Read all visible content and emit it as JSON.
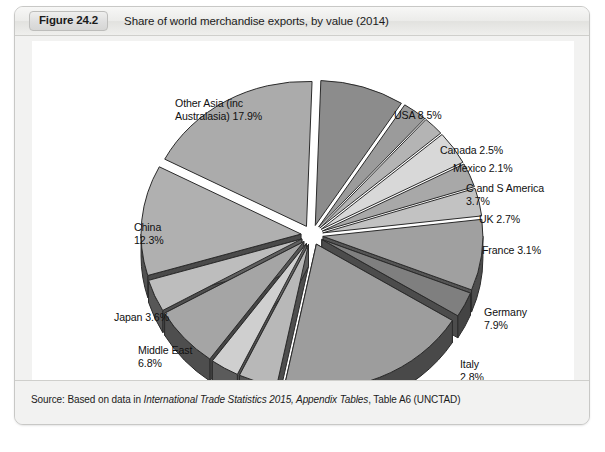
{
  "figure": {
    "badge": "Figure 24.2",
    "title": "Share of world merchandise exports, by value (2014)",
    "source_prefix": "Source: Based on data in ",
    "source_italic": "International Trade Statistics 2015, Appendix Tables",
    "source_suffix": ", Table A6 (UNCTAD)"
  },
  "chart_data": {
    "type": "pie",
    "title": "Share of world merchandise exports, by value (2014)",
    "unit": "%",
    "exploded": true,
    "three_d": true,
    "legend": "none",
    "labels_position": "outside",
    "total": 100.0,
    "categories": [
      "USA",
      "Canada",
      "Mexico",
      "C and S America",
      "UK",
      "France",
      "Germany",
      "Italy",
      "Other Europe",
      "CIS (former Soviet republics)",
      "Africa",
      "Middle East",
      "Japan",
      "China",
      "Other Asia (inc Australasia)"
    ],
    "values": [
      8.5,
      2.5,
      2.1,
      3.7,
      2.7,
      3.1,
      7.9,
      2.8,
      19.4,
      3.9,
      2.9,
      6.8,
      3.6,
      12.3,
      17.9
    ],
    "slices": [
      {
        "name": "USA",
        "value": 8.5,
        "label": "USA 8.5%",
        "top": "#8c8c8c",
        "side": "#4a4a4a"
      },
      {
        "name": "Canada",
        "value": 2.5,
        "label": "Canada 2.5%",
        "top": "#9b9b9b",
        "side": "#4f4f4f"
      },
      {
        "name": "Mexico",
        "value": 2.1,
        "label": "Mexico 2.1%",
        "top": "#b4b4b4",
        "side": "#565656"
      },
      {
        "name": "C and S America",
        "value": 3.7,
        "label": "C and S America\n3.7%",
        "top": "#d8d8d8",
        "side": "#5e5e5e"
      },
      {
        "name": "UK",
        "value": 2.7,
        "label": "UK 2.7%",
        "top": "#a8a8a8",
        "side": "#515151"
      },
      {
        "name": "France",
        "value": 3.1,
        "label": "France 3.1%",
        "top": "#c2c2c2",
        "side": "#595959"
      },
      {
        "name": "Germany",
        "value": 7.9,
        "label": "Germany\n7.9%",
        "top": "#a0a0a0",
        "side": "#4d4d4d"
      },
      {
        "name": "Italy",
        "value": 2.8,
        "label": "Italy\n2.8%",
        "top": "#7f7f7f",
        "side": "#444444"
      },
      {
        "name": "Other Europe",
        "value": 19.4,
        "label": "Other Europe\n19.4%",
        "top": "#9d9d9d",
        "side": "#494949"
      },
      {
        "name": "CIS (former Soviet republics)",
        "value": 3.9,
        "label": "CIS (former Soviet\nrepublics) 3.9%",
        "top": "#b8b8b8",
        "side": "#565656"
      },
      {
        "name": "Africa",
        "value": 2.9,
        "label": "Africa 2.9%",
        "top": "#cfcfcf",
        "side": "#5b5b5b"
      },
      {
        "name": "Middle East",
        "value": 6.8,
        "label": "Middle East\n6.8%",
        "top": "#a5a5a5",
        "side": "#4e4e4e"
      },
      {
        "name": "Japan",
        "value": 3.6,
        "label": "Japan 3.6%",
        "top": "#bdbdbd",
        "side": "#575757"
      },
      {
        "name": "China",
        "value": 12.3,
        "label": "China\n12.3%",
        "top": "#b0b0b0",
        "side": "#525252"
      },
      {
        "name": "Other Asia (inc Australasia)",
        "value": 17.9,
        "label": "Other Asia (inc\nAustralasia) 17.9%",
        "top": "#ababab",
        "side": "#505050"
      }
    ],
    "label_positions": [
      {
        "name": "USA",
        "x": 362,
        "y": 68,
        "align": "l"
      },
      {
        "name": "Canada",
        "x": 408,
        "y": 103,
        "align": "l"
      },
      {
        "name": "Mexico",
        "x": 421,
        "y": 121,
        "align": "l"
      },
      {
        "name": "C and S America",
        "x": 434,
        "y": 141,
        "align": "l"
      },
      {
        "name": "UK",
        "x": 447,
        "y": 172,
        "align": "l"
      },
      {
        "name": "France",
        "x": 450,
        "y": 203,
        "align": "l"
      },
      {
        "name": "Germany",
        "x": 452,
        "y": 265,
        "align": "l"
      },
      {
        "name": "Italy",
        "x": 428,
        "y": 317,
        "align": "l"
      },
      {
        "name": "Other Europe",
        "x": 328,
        "y": 375,
        "align": "l"
      },
      {
        "name": "CIS (former Soviet republics)",
        "x": 176,
        "y": 375,
        "align": "l"
      },
      {
        "name": "Africa",
        "x": 125,
        "y": 346,
        "align": "l"
      },
      {
        "name": "Middle East",
        "x": 106,
        "y": 303,
        "align": "l"
      },
      {
        "name": "Japan",
        "x": 82,
        "y": 270,
        "align": "l"
      },
      {
        "name": "China",
        "x": 102,
        "y": 180,
        "align": "l"
      },
      {
        "name": "Other Asia (inc Australasia)",
        "x": 143,
        "y": 56,
        "align": "l"
      }
    ],
    "geometry": {
      "cx": 280,
      "cy": 194,
      "rx": 160,
      "ry": 145,
      "depth": 22,
      "explode": 11,
      "start_angle": -88
    }
  }
}
